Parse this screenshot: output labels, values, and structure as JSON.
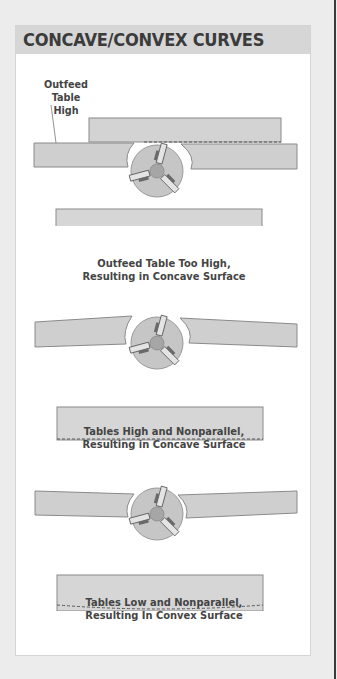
{
  "title": "CONCAVE/CONVEX CURVES",
  "colors": {
    "header_bg": "#d6d6d6",
    "title_text": "#3b3b3b",
    "table_fill": "#cfcfcf",
    "table_stroke": "#8a8a8a",
    "cutter_fill": "#c4c4c4",
    "hub_fill": "#a8a8a8",
    "caption_text": "#444444"
  },
  "diagrams": [
    {
      "callout": [
        "Outfeed",
        "Table High"
      ],
      "caption": [
        "Outfeed Table Too High,",
        "Resulting in Concave Surface"
      ],
      "surface": "concave"
    },
    {
      "caption": [
        "Tables High and Nonparallel,",
        "Resulting in Concave Surface"
      ],
      "surface": "concave"
    },
    {
      "caption": [
        "Tables Low and Nonparallel,",
        "Resulting In Convex Surface"
      ],
      "surface": "convex"
    }
  ]
}
